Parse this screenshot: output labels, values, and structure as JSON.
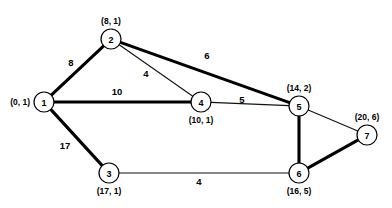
{
  "figure": {
    "title": "",
    "background_color": "#ffffff",
    "width": 392,
    "height": 208
  },
  "chart_data": {
    "type": "diagram",
    "subtype": "weighted-undirected-graph",
    "title": "",
    "xlabel": "",
    "ylabel": "",
    "grid": false,
    "legend": false,
    "nodes": [
      {
        "id": "1",
        "label": "1",
        "annotation": "(0, 1)",
        "x": 44,
        "y": 102,
        "r": 10,
        "annotation_x": 30,
        "annotation_y": 102,
        "annotation_anchor": "end"
      },
      {
        "id": "2",
        "label": "2",
        "annotation": "(8, 1)",
        "x": 111,
        "y": 39,
        "r": 10,
        "annotation_x": 111,
        "annotation_y": 21,
        "annotation_anchor": "middle"
      },
      {
        "id": "3",
        "label": "3",
        "annotation": "(17, 1)",
        "x": 109,
        "y": 173,
        "r": 10,
        "annotation_x": 109,
        "annotation_y": 191,
        "annotation_anchor": "middle"
      },
      {
        "id": "4",
        "label": "4",
        "annotation": "(10, 1)",
        "x": 201,
        "y": 102,
        "r": 10,
        "annotation_x": 201,
        "annotation_y": 120,
        "annotation_anchor": "middle"
      },
      {
        "id": "5",
        "label": "5",
        "annotation": "(14, 2)",
        "x": 299,
        "y": 106,
        "r": 10,
        "annotation_x": 299,
        "annotation_y": 88,
        "annotation_anchor": "middle"
      },
      {
        "id": "6",
        "label": "6",
        "annotation": "(16, 5)",
        "x": 299,
        "y": 173,
        "r": 10,
        "annotation_x": 299,
        "annotation_y": 191,
        "annotation_anchor": "middle"
      },
      {
        "id": "7",
        "label": "7",
        "annotation": "(20, 6)",
        "x": 367,
        "y": 135,
        "r": 10,
        "annotation_x": 367,
        "annotation_y": 117,
        "annotation_anchor": "middle"
      }
    ],
    "edges": [
      {
        "id": "e-1-2",
        "source": "1",
        "target": "2",
        "weight": "8",
        "bold": true,
        "label_x": 71,
        "label_y": 62
      },
      {
        "id": "e-2-4",
        "source": "2",
        "target": "4",
        "weight": "4",
        "bold": false,
        "label_x": 146,
        "label_y": 73
      },
      {
        "id": "e-2-5",
        "source": "2",
        "target": "5",
        "weight": "6",
        "bold": true,
        "label_x": 207,
        "label_y": 55
      },
      {
        "id": "e-1-4",
        "source": "1",
        "target": "4",
        "weight": "10",
        "bold": true,
        "label_x": 117,
        "label_y": 91
      },
      {
        "id": "e-4-5",
        "source": "4",
        "target": "5",
        "weight": "5",
        "bold": false,
        "label_x": 242,
        "label_y": 99
      },
      {
        "id": "e-1-3",
        "source": "1",
        "target": "3",
        "weight": "17",
        "bold": true,
        "label_x": 65,
        "label_y": 145
      },
      {
        "id": "e-3-6",
        "source": "3",
        "target": "6",
        "weight": "4",
        "bold": false,
        "label_x": 199,
        "label_y": 181
      },
      {
        "id": "e-5-6",
        "source": "5",
        "target": "6",
        "weight": "",
        "bold": true,
        "label_x": 0,
        "label_y": 0
      },
      {
        "id": "e-5-7",
        "source": "5",
        "target": "7",
        "weight": "",
        "bold": false,
        "label_x": 0,
        "label_y": 0
      },
      {
        "id": "e-6-7",
        "source": "6",
        "target": "7",
        "weight": "",
        "bold": true,
        "label_x": 0,
        "label_y": 0
      }
    ],
    "colors": {
      "edge_thin": "#111111",
      "edge_bold": "#000000",
      "node_fill": "#ffffff",
      "node_stroke": "#000000",
      "text": "#000000"
    }
  }
}
